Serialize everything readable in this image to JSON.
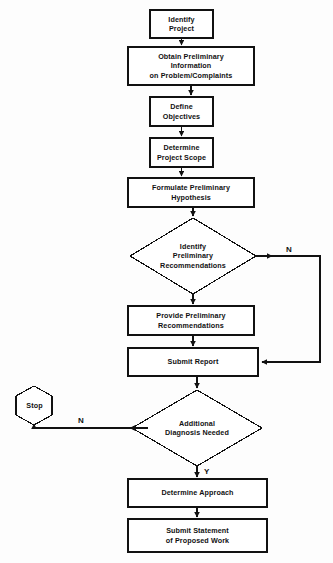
{
  "diagram": {
    "type": "flowchart",
    "canvas": {
      "width": 333,
      "height": 563
    },
    "style": {
      "stroke": "#111111",
      "fill": "#ffffff",
      "background": "#fdfdfd",
      "text_color": "#111111"
    },
    "nodes": [
      {
        "id": "identify-project",
        "shape": "process",
        "label": "Identify\nProject",
        "x": 150,
        "y": 10,
        "w": 63,
        "h": 28
      },
      {
        "id": "obtain-preliminary-information",
        "shape": "process",
        "label": "Obtain Preliminary\nInformation\non Problem/Complaints",
        "x": 128,
        "y": 47,
        "w": 126,
        "h": 38
      },
      {
        "id": "define-objectives",
        "shape": "process",
        "label": "Define\nObjectives",
        "x": 150,
        "y": 97,
        "w": 63,
        "h": 29
      },
      {
        "id": "determine-project-scope",
        "shape": "process",
        "label": "Determine\nProject Scope",
        "x": 150,
        "y": 138,
        "w": 63,
        "h": 29
      },
      {
        "id": "formulate-preliminary-hypothesis",
        "shape": "process",
        "label": "Formulate Preliminary\nHypothesis",
        "x": 128,
        "y": 178,
        "w": 126,
        "h": 29
      },
      {
        "id": "identify-preliminary-recommendations",
        "shape": "decision",
        "label": "Identify\nPreliminary\nRecommendations",
        "x": 130,
        "y": 218,
        "w": 126,
        "h": 76
      },
      {
        "id": "provide-preliminary-recommendations",
        "shape": "process",
        "label": "Provide Preliminary\nRecommendations",
        "x": 128,
        "y": 306,
        "w": 126,
        "h": 29
      },
      {
        "id": "submit-report",
        "shape": "process",
        "label": "Submit Report",
        "x": 128,
        "y": 348,
        "w": 130,
        "h": 28
      },
      {
        "id": "stop",
        "shape": "terminator-hexagon",
        "label": "Stop",
        "x": 13,
        "y": 386,
        "w": 43,
        "h": 38
      },
      {
        "id": "additional-diagnosis-needed",
        "shape": "decision",
        "label": "Additional\nDiagnosis Needed",
        "x": 132,
        "y": 390,
        "w": 130,
        "h": 76
      },
      {
        "id": "determine-approach",
        "shape": "process",
        "label": "Determine Approach",
        "x": 128,
        "y": 479,
        "w": 139,
        "h": 28
      },
      {
        "id": "submit-statement-of-proposed-work",
        "shape": "process",
        "label": "Submit Statement\nof Proposed Work",
        "x": 128,
        "y": 519,
        "w": 139,
        "h": 33
      }
    ],
    "edges": [
      {
        "id": "e1",
        "from": "identify-project",
        "to": "obtain-preliminary-information",
        "label": ""
      },
      {
        "id": "e2",
        "from": "obtain-preliminary-information",
        "to": "define-objectives",
        "label": ""
      },
      {
        "id": "e3",
        "from": "define-objectives",
        "to": "determine-project-scope",
        "label": ""
      },
      {
        "id": "e4",
        "from": "determine-project-scope",
        "to": "formulate-preliminary-hypothesis",
        "label": ""
      },
      {
        "id": "e5",
        "from": "formulate-preliminary-hypothesis",
        "to": "identify-preliminary-recommendations",
        "label": ""
      },
      {
        "id": "e6",
        "from": "identify-preliminary-recommendations",
        "to": "provide-preliminary-recommendations",
        "label": ""
      },
      {
        "id": "e7",
        "from": "identify-preliminary-recommendations",
        "to": "submit-report",
        "label": "N"
      },
      {
        "id": "e8",
        "from": "provide-preliminary-recommendations",
        "to": "submit-report",
        "label": ""
      },
      {
        "id": "e9",
        "from": "submit-report",
        "to": "additional-diagnosis-needed",
        "label": ""
      },
      {
        "id": "e10",
        "from": "additional-diagnosis-needed",
        "to": "stop",
        "label": "N"
      },
      {
        "id": "e11",
        "from": "additional-diagnosis-needed",
        "to": "determine-approach",
        "label": "Y"
      },
      {
        "id": "e12",
        "from": "determine-approach",
        "to": "submit-statement-of-proposed-work",
        "label": ""
      }
    ],
    "edge_labels": {
      "no_recommendations": "N",
      "no_diagnosis": "N",
      "yes_diagnosis": "Y"
    }
  }
}
